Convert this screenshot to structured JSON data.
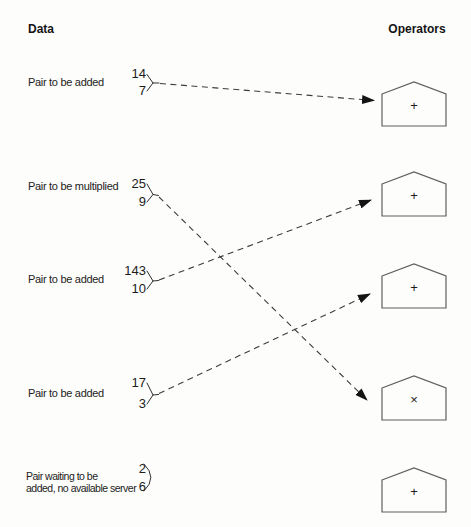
{
  "headers": {
    "data": "Data",
    "operators": "Operators"
  },
  "pairs": [
    {
      "label": "Pair to be added",
      "top_value": "14",
      "bottom_value": "7"
    },
    {
      "label": "Pair to be multiplied",
      "top_value": "25",
      "bottom_value": "9"
    },
    {
      "label": "Pair to be added",
      "top_value": "143",
      "bottom_value": "10"
    },
    {
      "label": "Pair to be added",
      "top_value": "17",
      "bottom_value": "3"
    },
    {
      "label_line1": "Pair waiting to be",
      "label_line2": "added, no available server",
      "top_value": "2",
      "bottom_value": "6"
    }
  ],
  "operators": [
    {
      "symbol": "+"
    },
    {
      "symbol": "+"
    },
    {
      "symbol": "+"
    },
    {
      "symbol": "×"
    },
    {
      "symbol": "+"
    }
  ],
  "connections": [
    {
      "from_pair": "14, 7",
      "to_operator": 1
    },
    {
      "from_pair": "25, 9",
      "to_operator": 4
    },
    {
      "from_pair": "143, 10",
      "to_operator": 2
    },
    {
      "from_pair": "17, 3",
      "to_operator": 3
    }
  ],
  "colors": {
    "background": "#fdfdfb",
    "ink": "#1e1e1e",
    "line": "#3d3d3d",
    "shape_stroke": "#5f5f5f"
  }
}
